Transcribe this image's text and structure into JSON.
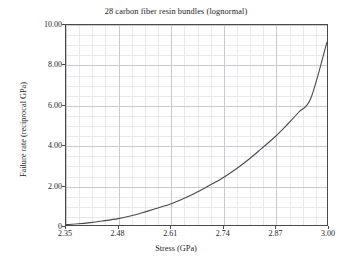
{
  "chart_data": {
    "type": "line",
    "title": "28 carbon fiber resin bundles (lognormal)",
    "xlabel": "Stress (GPa)",
    "ylabel": "Failure rate (reciprocal GPa)",
    "xlim": [
      2.35,
      3.0
    ],
    "ylim": [
      0.0,
      10.0
    ],
    "grid": true,
    "minor_grid": true,
    "legend": "none",
    "xticks": [
      2.35,
      2.48,
      2.61,
      2.74,
      2.87,
      3.0
    ],
    "xtick_labels": [
      "2.35",
      "2.48",
      "2.61",
      "2.74",
      "2.87",
      "3.00"
    ],
    "yticks": [
      0,
      2.0,
      4.0,
      6.0,
      8.0,
      10.0
    ],
    "ytick_labels": [
      "0",
      "2.00",
      "4.00",
      "6.00",
      "8.00",
      "10.00"
    ],
    "minor_per_major_x": 4,
    "minor_per_major_y": 4,
    "series": [
      {
        "name": "lognormal hazard",
        "color": "#4a4a4a",
        "x": [
          2.35,
          2.38,
          2.41,
          2.44,
          2.48,
          2.51,
          2.54,
          2.57,
          2.61,
          2.64,
          2.67,
          2.7,
          2.74,
          2.77,
          2.8,
          2.83,
          2.87,
          2.9,
          2.93,
          2.96,
          3.0
        ],
        "y": [
          0.02,
          0.06,
          0.12,
          0.2,
          0.32,
          0.45,
          0.61,
          0.8,
          1.05,
          1.3,
          1.58,
          1.9,
          2.35,
          2.75,
          3.2,
          3.7,
          4.4,
          5.0,
          5.65,
          6.35,
          9.15
        ]
      }
    ],
    "annotations": []
  },
  "figure": {
    "title": "28 carbon fiber resin bundles (lognormal)",
    "xaxis_title": "Stress (GPa)",
    "yaxis_title": "Failure rate (reciprocal GPa)"
  }
}
